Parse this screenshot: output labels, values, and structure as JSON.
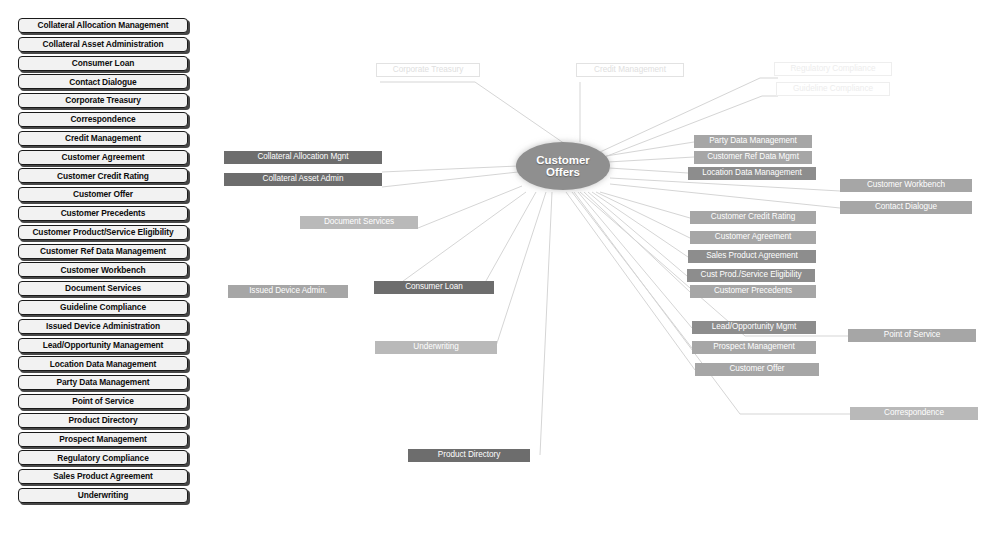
{
  "legend": {
    "items": [
      {
        "label": "Collateral Allocation Management"
      },
      {
        "label": "Collateral Asset Administration"
      },
      {
        "label": "Consumer Loan"
      },
      {
        "label": "Contact Dialogue"
      },
      {
        "label": "Corporate Treasury"
      },
      {
        "label": "Correspondence"
      },
      {
        "label": "Credit Management"
      },
      {
        "label": "Customer Agreement"
      },
      {
        "label": "Customer Credit Rating"
      },
      {
        "label": "Customer Offer"
      },
      {
        "label": "Customer Precedents"
      },
      {
        "label": "Customer Product/Service Eligibility"
      },
      {
        "label": "Customer Ref Data Management"
      },
      {
        "label": "Customer Workbench"
      },
      {
        "label": "Document Services"
      },
      {
        "label": "Guideline Compliance"
      },
      {
        "label": "Issued Device Administration"
      },
      {
        "label": "Lead/Opportunity Management"
      },
      {
        "label": "Location Data Management"
      },
      {
        "label": "Party Data Management"
      },
      {
        "label": "Point of Service"
      },
      {
        "label": "Product Directory"
      },
      {
        "label": "Prospect Management"
      },
      {
        "label": "Regulatory Compliance"
      },
      {
        "label": "Sales Product Agreement"
      },
      {
        "label": "Underwriting"
      }
    ]
  },
  "diagram": {
    "hub": {
      "line1": "Customer",
      "line2": "Offers"
    },
    "ghost_nodes": [
      {
        "label": "Corporate Treasury"
      },
      {
        "label": "Credit Management"
      },
      {
        "label": "Regulatory Compliance"
      },
      {
        "label": "Guideline Compliance"
      }
    ],
    "nodes": [
      {
        "label": "Collateral Allocation Mgnt"
      },
      {
        "label": "Collateral Asset Admin"
      },
      {
        "label": "Document Services"
      },
      {
        "label": "Issued Device Admin."
      },
      {
        "label": "Consumer Loan"
      },
      {
        "label": "Underwriting"
      },
      {
        "label": "Product Directory"
      },
      {
        "label": "Party Data Management"
      },
      {
        "label": "Customer Ref Data Mgmt"
      },
      {
        "label": "Location Data Management"
      },
      {
        "label": "Customer Workbench"
      },
      {
        "label": "Contact Dialogue"
      },
      {
        "label": "Customer Credit Rating"
      },
      {
        "label": "Customer Agreement"
      },
      {
        "label": "Sales Product Agreement"
      },
      {
        "label": "Cust Prod./Service Eligibility"
      },
      {
        "label": "Customer Precedents"
      },
      {
        "label": "Lead/Opportunity Mgmt"
      },
      {
        "label": "Prospect Management"
      },
      {
        "label": "Customer Offer"
      },
      {
        "label": "Point of Service"
      },
      {
        "label": "Correspondence"
      }
    ],
    "colors": {
      "hub_fill": "#8f8f8f",
      "hub_text": "#ffffff",
      "chip_dark": "#6d6d6d",
      "chip_mid": "#8d8d8d",
      "chip_light": "#a6a6a6",
      "chip_pale": "#b9b9b9",
      "wire": "#d3d3d3",
      "ghost_text": "#e0e0e0",
      "legend_fill": "#f2f2f2",
      "legend_border": "#1a1a1a"
    }
  }
}
